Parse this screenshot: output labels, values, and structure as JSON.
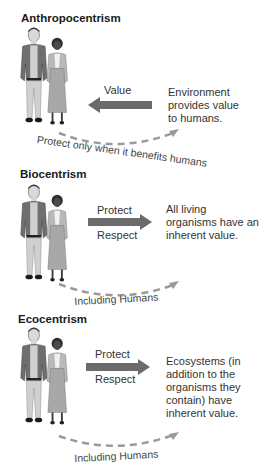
{
  "colors": {
    "arrow": "#6b6b6b",
    "dashed_curve": "#9a9a9a",
    "text": "#333333",
    "man_jacket": "#6f6f6f",
    "man_pants": "#cfcfcf",
    "woman_cardigan": "#b9b9b9",
    "woman_skirt": "#a8a8a8",
    "skin_dark": "#3a3a3a",
    "skin_light": "#e0e0e0"
  },
  "panels": [
    {
      "id": "anthropocentrism",
      "title": "Anthropocentrism",
      "arrow_direction": "left",
      "arrow_labels": [
        "Value"
      ],
      "description": [
        "Environment",
        "provides value",
        "to humans."
      ],
      "curve_label": "Protect only when it benefits humans"
    },
    {
      "id": "biocentrism",
      "title": "Biocentrism",
      "arrow_direction": "right",
      "arrow_labels": [
        "Protect",
        "Respect"
      ],
      "description": [
        "All living",
        "organisms have an",
        "inherent value."
      ],
      "curve_label": "Including Humans"
    },
    {
      "id": "ecocentrism",
      "title": "Ecocentrism",
      "arrow_direction": "right",
      "arrow_labels": [
        "Protect",
        "Respect"
      ],
      "description": [
        "Ecosystems (in",
        "addition to the",
        "organisms they",
        "contain) have",
        "inherent value."
      ],
      "curve_label": "Including Humans"
    }
  ]
}
